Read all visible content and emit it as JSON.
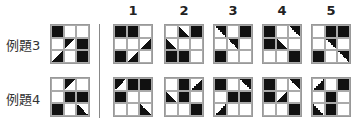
{
  "rows": [
    {
      "label": "例題3",
      "example": [
        [
          "b",
          "w",
          "w"
        ],
        [
          "w",
          "tl",
          "b"
        ],
        [
          "br",
          "w",
          "b"
        ]
      ],
      "options": [
        [
          [
            "b",
            "b",
            "w"
          ],
          [
            "w",
            "w",
            "br"
          ],
          [
            "b",
            "br",
            "w"
          ]
        ],
        [
          [
            "w",
            "bl",
            "b"
          ],
          [
            "bl",
            "w",
            "w"
          ],
          [
            "b",
            "b",
            "w"
          ]
        ],
        [
          [
            "tr",
            "w",
            "b"
          ],
          [
            "w",
            "tr",
            "w"
          ],
          [
            "b",
            "w",
            "w"
          ]
        ],
        [
          [
            "b",
            "w",
            "tr"
          ],
          [
            "b",
            "bl",
            "w"
          ],
          [
            "w",
            "w",
            "b"
          ]
        ],
        [
          [
            "w",
            "b",
            "b"
          ],
          [
            "w",
            "tr",
            "w"
          ],
          [
            "b",
            "w",
            "tr"
          ]
        ]
      ]
    },
    {
      "label": "例題4",
      "example": [
        [
          "w",
          "tl",
          "w"
        ],
        [
          "w",
          "b",
          "b"
        ],
        [
          "b",
          "w",
          "bl"
        ]
      ],
      "options": [
        [
          [
            "tl",
            "b",
            "b"
          ],
          [
            "b",
            "w",
            "w"
          ],
          [
            "w",
            "w",
            "bl"
          ]
        ],
        [
          [
            "w",
            "b",
            "br"
          ],
          [
            "bl",
            "b",
            "w"
          ],
          [
            "w",
            "w",
            "b"
          ]
        ],
        [
          [
            "b",
            "w",
            "tr"
          ],
          [
            "w",
            "b",
            "b"
          ],
          [
            "br",
            "w",
            "w"
          ]
        ],
        [
          [
            "b",
            "w",
            "tr"
          ],
          [
            "b",
            "br",
            "w"
          ],
          [
            "w",
            "w",
            "b"
          ]
        ],
        [
          [
            "br",
            "w",
            "b"
          ],
          [
            "w",
            "b",
            "w"
          ],
          [
            "bl",
            "b",
            "w"
          ]
        ]
      ]
    }
  ],
  "option_numbers": [
    "1",
    "2",
    "3",
    "4",
    "5"
  ]
}
